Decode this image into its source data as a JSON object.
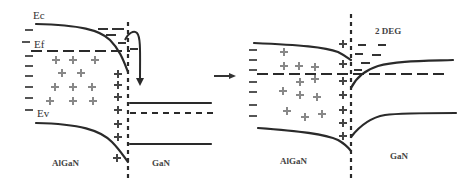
{
  "figure": {
    "left_panel": {
      "labels": {
        "conduction_band": "Ec",
        "fermi_level": "Ef",
        "valence_band": "Ev",
        "left_material": "AlGaN",
        "right_material": "GaN"
      }
    },
    "transition_arrow": "→",
    "right_panel": {
      "labels": {
        "two_deg": "2 DEG",
        "left_material": "AlGaN",
        "right_material": "GaN"
      }
    },
    "colors": {
      "line": "#2a2a2a",
      "interior_charge": "#888888",
      "interface_charge": "#444444",
      "background": "#ffffff"
    }
  }
}
